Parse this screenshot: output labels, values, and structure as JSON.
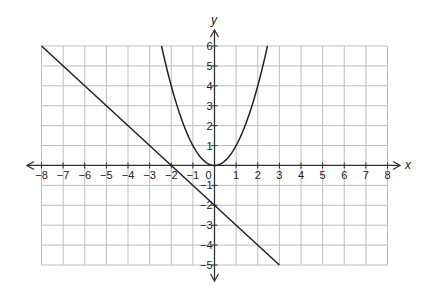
{
  "chart_data": {
    "type": "line",
    "title": "",
    "xlabel": "x",
    "ylabel": "y",
    "xlim": [
      -8,
      8
    ],
    "ylim": [
      -5,
      6
    ],
    "grid": true,
    "x_ticks": [
      -8,
      -7,
      -6,
      -5,
      -4,
      -3,
      -2,
      -1,
      0,
      1,
      2,
      3,
      4,
      5,
      6,
      7,
      8
    ],
    "y_ticks": [
      -5,
      -4,
      -3,
      -2,
      -1,
      1,
      2,
      3,
      4,
      5,
      6
    ],
    "series": [
      {
        "name": "line",
        "equation": "y = -x - 2",
        "points": [
          [
            -8,
            6
          ],
          [
            -4,
            2
          ],
          [
            -2,
            0
          ],
          [
            0,
            -2
          ],
          [
            3,
            -5
          ]
        ]
      },
      {
        "name": "parabola",
        "equation": "y = x^2",
        "points": [
          [
            -2.45,
            6
          ],
          [
            -2,
            4
          ],
          [
            -1,
            1
          ],
          [
            0,
            0
          ],
          [
            1,
            1
          ],
          [
            2,
            4
          ],
          [
            2.45,
            6
          ]
        ]
      }
    ]
  },
  "labels": {
    "x_axis": "x",
    "y_axis": "y",
    "origin": "0"
  },
  "colors": {
    "grid": "#bdbdbd",
    "axis": "#333333",
    "curve": "#222222"
  }
}
